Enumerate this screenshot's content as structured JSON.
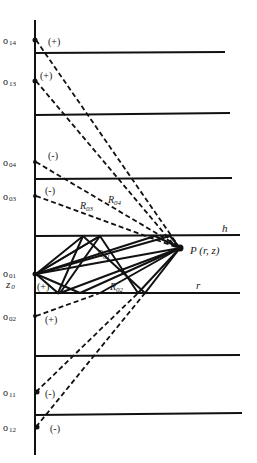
{
  "diagram": {
    "title": "",
    "axis": {
      "x": 35,
      "y_top": 20,
      "y_bottom": 455
    },
    "layers": [
      {
        "id": "l1",
        "y": 53,
        "x_end": 225
      },
      {
        "id": "l2",
        "y": 115,
        "x_end": 230
      },
      {
        "id": "l3",
        "y": 179,
        "x_end": 232
      },
      {
        "id": "h",
        "y": 236,
        "x_end": 240,
        "label": "h"
      },
      {
        "id": "r",
        "y": 293,
        "x_end": 240,
        "label": "r"
      },
      {
        "id": "l6",
        "y": 356,
        "x_end": 240
      },
      {
        "id": "l7",
        "y": 413,
        "x_end": 242
      }
    ],
    "sources": [
      {
        "id": "o14",
        "base": "o",
        "sub": "14",
        "y": 40,
        "sign": "(+)"
      },
      {
        "id": "o13",
        "base": "o",
        "sub": "13",
        "y": 81,
        "sign": "(+)"
      },
      {
        "id": "o04",
        "base": "o",
        "sub": "04",
        "y": 162,
        "sign": "(-)"
      },
      {
        "id": "o03",
        "base": "o",
        "sub": "03",
        "y": 196,
        "sign": "(-)"
      },
      {
        "id": "o01",
        "base": "o",
        "sub": "01",
        "y": 274,
        "sign": "(+)"
      },
      {
        "id": "o02",
        "base": "o",
        "sub": "02",
        "y": 316,
        "sign": "(+)"
      },
      {
        "id": "o11",
        "base": "o",
        "sub": "11",
        "y": 392,
        "sign": "(-)"
      },
      {
        "id": "o12",
        "base": "o",
        "sub": "12",
        "y": 427,
        "sign": "(-)"
      }
    ],
    "source_depth_label": {
      "base": "z",
      "sub": "0"
    },
    "field_point": {
      "label": "P (r, z)",
      "x": 180,
      "y": 248
    },
    "distance_labels": [
      {
        "base": "R",
        "sub": "04"
      },
      {
        "base": "R",
        "sub": "03"
      },
      {
        "base": "R",
        "sub": "01"
      },
      {
        "base": "R",
        "sub": "02"
      }
    ],
    "legend": {
      "solid_lines": "real ray paths (reflections between h and r)",
      "dashed_lines": "image source paths"
    }
  }
}
